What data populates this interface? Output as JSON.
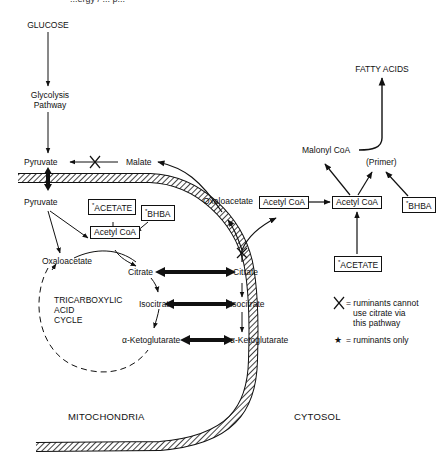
{
  "diagram": {
    "title_fragment": "...ergy / ... p...",
    "compartments": {
      "mitochondria": "MITOCHONDRIA",
      "cytosol": "CYTOSOL"
    },
    "nodes": {
      "glucose": "GLUCOSE",
      "glycolysis": "Glycolysis\nPathway",
      "pyruvate_cyto": "Pyruvate",
      "malate": "Malate",
      "pyruvate_mito": "Pyruvate",
      "acetate_mito": "ACETATE",
      "bhba_mito": "BHBA",
      "acetylcoa_mito": "Acetyl CoA",
      "oxaloacetate_mito": "Oxaloacetate",
      "citrate_mito": "Citrate",
      "tca_cycle": "TRICARBOXYLIC\nACID\nCYCLE",
      "isocitrate_mito": "Isocitrate",
      "akg_mito": "α-Ketoglutarate",
      "oxaloacetate_cyto": "Oxaloacetate",
      "citrate_cyto": "Citrate",
      "isocitrate_cyto": "Isocitrate",
      "akg_cyto": "α-Ketoglutarate",
      "acetylcoa_cyto1": "Acetyl CoA",
      "acetylcoa_cyto2": "Acetyl CoA",
      "malonylcoa": "Malonyl CoA",
      "primer": "(Primer)",
      "bhba_cyto": "BHBA",
      "acetate_cyto": "ACETATE",
      "fatty_acids": "FATTY ACIDS"
    },
    "star_marker": "*",
    "legend": {
      "x_symbol": "X",
      "x_text": "= ruminants cannot\n   use citrate via\n   this pathway",
      "star_symbol": "★",
      "star_text": "= ruminants only"
    }
  }
}
